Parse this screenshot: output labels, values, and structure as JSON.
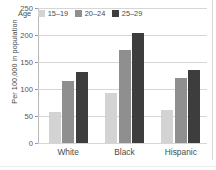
{
  "chart_data": {
    "type": "bar",
    "title": "",
    "subtitle": "",
    "xlabel": "",
    "ylabel": "Per 100,000 in population",
    "categories": [
      "White",
      "Black",
      "Hispanic"
    ],
    "series": [
      {
        "name": "15–19",
        "values": [
          57,
          93,
          61
        ],
        "color": "#d3d3d3"
      },
      {
        "name": "20–24",
        "values": [
          114,
          172,
          120
        ],
        "color": "#8f8f8f"
      },
      {
        "name": "25–29",
        "values": [
          131,
          204,
          136
        ],
        "color": "#3d3d3d"
      }
    ],
    "ylim": [
      0,
      250
    ],
    "yticks": [
      0,
      50,
      100,
      150,
      200,
      250
    ],
    "ytick_labels": [
      "0",
      "50",
      "100",
      "150",
      "200",
      "250"
    ],
    "grid": true,
    "grid_axis": "y",
    "legend_title": "Age",
    "legend_position": "top-left-inside",
    "orientation": "vertical",
    "grouping": "grouped"
  },
  "legend": {
    "title": "Age",
    "entries": [
      {
        "label": "15–19",
        "swatch": "legend-swatch-15-19"
      },
      {
        "label": "20–24",
        "swatch": "legend-swatch-20-24"
      },
      {
        "label": "25–29",
        "swatch": "legend-swatch-25-29"
      }
    ]
  },
  "axes": {
    "y_title": "Per 100,000 in population",
    "y_tick_labels": [
      "250",
      "200",
      "150",
      "100",
      "50",
      "0"
    ],
    "x_tick_labels": [
      "White",
      "Black",
      "Hispanic"
    ]
  },
  "colors": {
    "series_1": "#d3d3d3",
    "series_2": "#8f8f8f",
    "series_3": "#3d3d3d",
    "gridline": "#d6d6d6",
    "axis": "#b8b8b8",
    "text": "#4a4a4a",
    "background": "#ffffff"
  }
}
